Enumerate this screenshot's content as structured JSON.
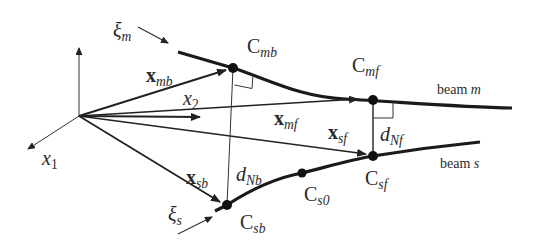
{
  "diagram": {
    "colors": {
      "ink": "#222222",
      "background": "#ffffff"
    },
    "axes": {
      "x1": {
        "base": "x",
        "sub": "1"
      },
      "x2": {
        "base": "x",
        "sub": "2"
      }
    },
    "tangents": {
      "xi_m": {
        "base": "ξ",
        "sub": "m"
      },
      "xi_s": {
        "base": "ξ",
        "sub": "s"
      }
    },
    "points": {
      "C_mb": {
        "base": "C",
        "sub": "mb"
      },
      "C_mf": {
        "base": "C",
        "sub": "mf"
      },
      "C_sb": {
        "base": "C",
        "sub": "sb"
      },
      "C_s0": {
        "base": "C",
        "sub": "s0"
      },
      "C_sf": {
        "base": "C",
        "sub": "sf"
      }
    },
    "vectors": {
      "x_mb": {
        "base": "x",
        "sub": "mb"
      },
      "x_mf": {
        "base": "x",
        "sub": "mf"
      },
      "x_sf": {
        "base": "x",
        "sub": "sf"
      },
      "x_sb": {
        "base": "x",
        "sub": "sb"
      }
    },
    "distances": {
      "d_Nb": {
        "base": "d",
        "sub": "Nb"
      },
      "d_Nf": {
        "base": "d",
        "sub": "Nf"
      }
    },
    "beams": {
      "m": {
        "prefix": "beam ",
        "name": "m"
      },
      "s": {
        "prefix": "beam ",
        "name": "s"
      }
    }
  }
}
